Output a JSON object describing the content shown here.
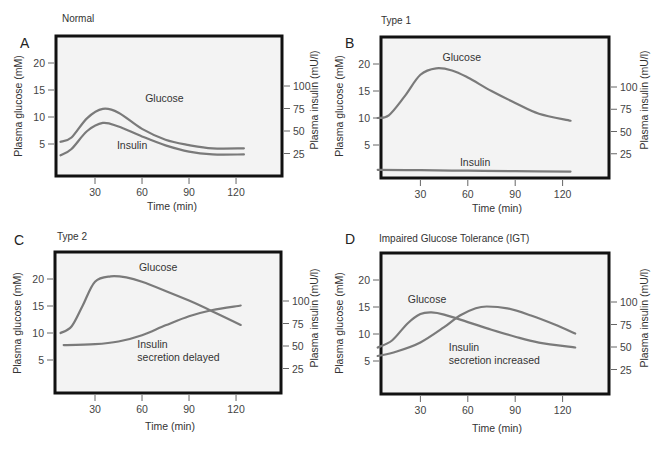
{
  "figure": {
    "panels": [
      {
        "letter": "A",
        "title": "Normal"
      },
      {
        "letter": "B",
        "title": "Type 1"
      },
      {
        "letter": "C",
        "title": "Type 2"
      },
      {
        "letter": "D",
        "title": "Impaired Glucose Tolerance (IGT)"
      }
    ]
  },
  "chart_data": [
    {
      "type": "line",
      "panel": "A",
      "title": "Normal",
      "xlabel": "Time (min)",
      "ylabel": "Plasma glucose (mM)",
      "y2label": "Plasma insulin (mU/l)",
      "xticks": [
        30,
        60,
        90,
        120
      ],
      "yticks": [
        5,
        10,
        15,
        20
      ],
      "y2ticks": [
        25,
        50,
        75,
        100
      ],
      "grid": false,
      "curve_labels": [
        {
          "text": "Glucose",
          "x": 62,
          "y": 12.8
        },
        {
          "text": "Insulin",
          "x": 44,
          "y": 4
        }
      ],
      "series": [
        {
          "name": "Glucose",
          "axis": "left",
          "x": [
            8,
            15,
            25,
            35,
            45,
            60,
            75,
            90,
            105,
            125
          ],
          "values": [
            5.4,
            6.2,
            9.8,
            11.5,
            10.8,
            7.8,
            5.8,
            4.8,
            4.2,
            4.2
          ]
        },
        {
          "name": "Insulin",
          "axis": "right",
          "x": [
            8,
            15,
            25,
            35,
            45,
            60,
            75,
            90,
            105,
            125
          ],
          "values": [
            23,
            30,
            50,
            59,
            55,
            44,
            34,
            27,
            24,
            24
          ]
        }
      ]
    },
    {
      "type": "line",
      "panel": "B",
      "title": "Type 1",
      "xlabel": "Time (min)",
      "ylabel": "Plasma glucose (mM)",
      "y2label": "Plasma insulin (mU/l)",
      "xticks": [
        30,
        60,
        90,
        120
      ],
      "yticks": [
        5,
        10,
        15,
        20
      ],
      "y2ticks": [
        25,
        50,
        75,
        100
      ],
      "grid": false,
      "curve_labels": [
        {
          "text": "Glucose",
          "x": 44,
          "y": 20.5
        },
        {
          "text": "Insulin",
          "x": 55,
          "y": 1.2
        }
      ],
      "series": [
        {
          "name": "Glucose",
          "axis": "left",
          "x": [
            3,
            10,
            20,
            30,
            40,
            50,
            60,
            75,
            90,
            105,
            125
          ],
          "values": [
            10,
            10.5,
            14,
            18,
            19.2,
            18.8,
            17.5,
            15,
            12.8,
            10.8,
            9.5
          ]
        },
        {
          "name": "Insulin",
          "axis": "right",
          "x": [
            3,
            30,
            60,
            90,
            125
          ],
          "values": [
            7,
            6.5,
            6,
            5.5,
            5
          ]
        }
      ]
    },
    {
      "type": "line",
      "panel": "C",
      "title": "Type 2",
      "xlabel": "Time (min)",
      "ylabel": "Plasma glucose (mM)",
      "y2label": "Plasma insulin (mU/l)",
      "xticks": [
        30,
        60,
        90,
        120
      ],
      "yticks": [
        5,
        10,
        15,
        20
      ],
      "y2ticks": [
        25,
        50,
        75,
        100
      ],
      "grid": false,
      "curve_labels": [
        {
          "text": "Glucose",
          "x": 58,
          "y": 21.5
        },
        {
          "text": "Insulin",
          "x": 57,
          "y": 7.2
        },
        {
          "text": "secretion delayed",
          "x": 57,
          "y": 4.8
        }
      ],
      "series": [
        {
          "name": "Glucose",
          "axis": "left",
          "x": [
            8,
            15,
            22,
            30,
            40,
            50,
            60,
            75,
            90,
            105,
            123
          ],
          "values": [
            10,
            11.2,
            15,
            19.5,
            20.5,
            20.3,
            19.5,
            17.8,
            16,
            14,
            11.5
          ]
        },
        {
          "name": "Insulin",
          "axis": "right",
          "x": [
            10,
            30,
            45,
            60,
            75,
            90,
            105,
            123
          ],
          "values": [
            51,
            52,
            55,
            62,
            73,
            83,
            90,
            95
          ]
        }
      ]
    },
    {
      "type": "line",
      "panel": "D",
      "title": "Impaired Glucose Tolerance (IGT)",
      "xlabel": "Time (min)",
      "ylabel": "Plasma glucose (mM)",
      "y2label": "Plasma insulin (mU/l)",
      "xticks": [
        30,
        60,
        90,
        120
      ],
      "yticks": [
        5,
        10,
        15,
        20
      ],
      "y2ticks": [
        25,
        50,
        75,
        100
      ],
      "grid": false,
      "curve_labels": [
        {
          "text": "Glucose",
          "x": 22,
          "y": 15.8
        },
        {
          "text": "Insulin",
          "x": 48,
          "y": 6.8
        },
        {
          "text": "secretion increased",
          "x": 48,
          "y": 4.4
        }
      ],
      "series": [
        {
          "name": "Glucose",
          "axis": "left",
          "x": [
            3,
            12,
            22,
            30,
            37,
            45,
            60,
            75,
            90,
            105,
            128
          ],
          "values": [
            7.5,
            8.8,
            12,
            13.7,
            14,
            13.6,
            12.2,
            10.8,
            9.5,
            8.4,
            7.5
          ]
        },
        {
          "name": "Insulin",
          "axis": "right",
          "x": [
            3,
            15,
            30,
            45,
            55,
            65,
            72,
            85,
            100,
            115,
            128
          ],
          "values": [
            40,
            45,
            55,
            72,
            85,
            93,
            95,
            93,
            85,
            75,
            65
          ]
        }
      ]
    }
  ]
}
